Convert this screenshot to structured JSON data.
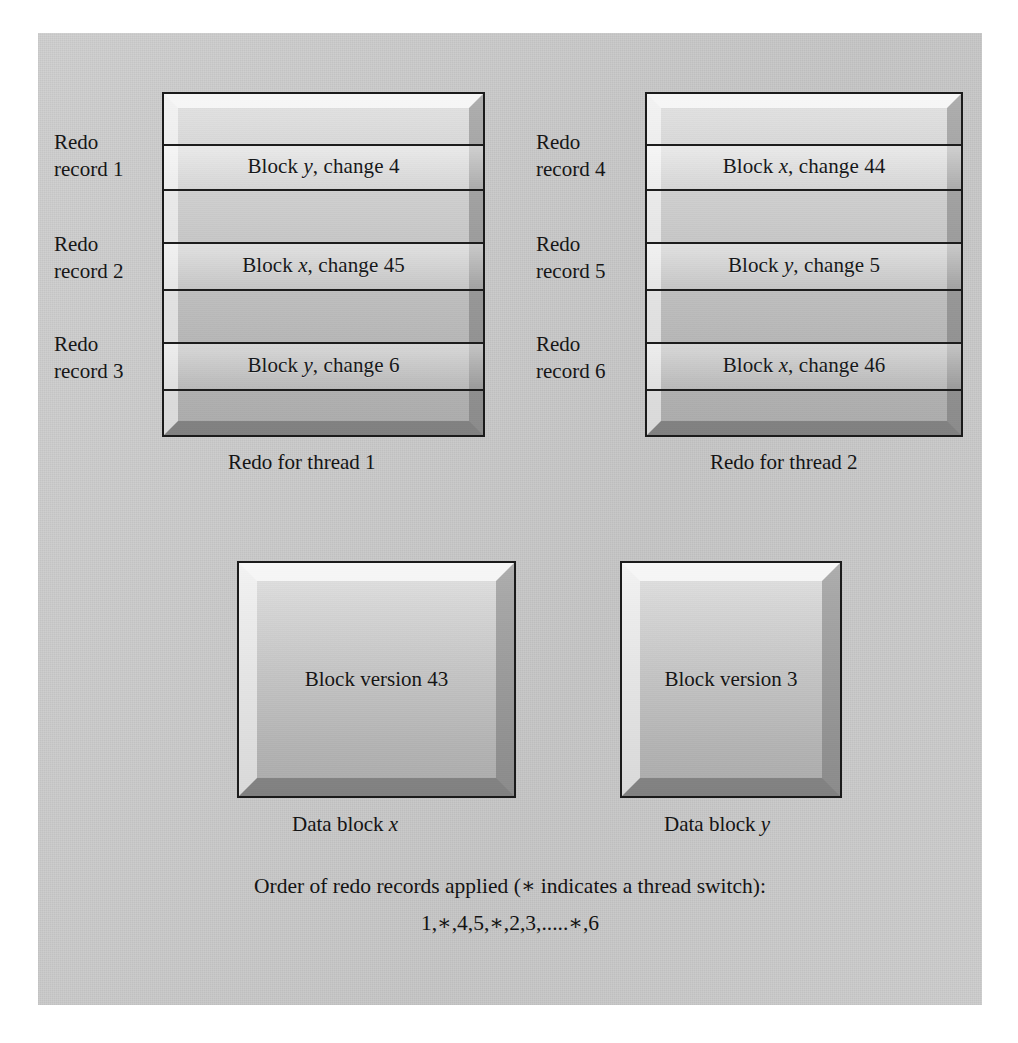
{
  "figure": {
    "background_color": "#ffffff",
    "panel_color": "#c9c9c9",
    "ink_color": "#161616"
  },
  "redo_threads": [
    {
      "id": "thread-1",
      "caption": "Redo for thread 1",
      "records": [
        {
          "label": "Redo\nrecord 1",
          "change_prefix": "Block ",
          "change_var": "y",
          "change_suffix": ", change 4"
        },
        {
          "label": "Redo\nrecord 2",
          "change_prefix": "Block ",
          "change_var": "x",
          "change_suffix": ", change 45"
        },
        {
          "label": "Redo\nrecord 3",
          "change_prefix": "Block ",
          "change_var": "y",
          "change_suffix": ", change 6"
        }
      ]
    },
    {
      "id": "thread-2",
      "caption": "Redo for thread 2",
      "records": [
        {
          "label": "Redo\nrecord 4",
          "change_prefix": "Block ",
          "change_var": "x",
          "change_suffix": ", change 44"
        },
        {
          "label": "Redo\nrecord 5",
          "change_prefix": "Block ",
          "change_var": "y",
          "change_suffix": ", change 5"
        },
        {
          "label": "Redo\nrecord 6",
          "change_prefix": "Block ",
          "change_var": "x",
          "change_suffix": ", change 46"
        }
      ]
    }
  ],
  "data_blocks": [
    {
      "id": "data-block-x",
      "version_text": "Block version 43",
      "caption_prefix": "Data block ",
      "caption_var": "x"
    },
    {
      "id": "data-block-y",
      "version_text": "Block version 3",
      "caption_prefix": "Data block ",
      "caption_var": "y"
    }
  ],
  "footer": {
    "order_line_1": "Order of redo records applied (∗ indicates a thread switch):",
    "order_line_2": "1,∗,4,5,∗,2,3,.....∗,6"
  }
}
